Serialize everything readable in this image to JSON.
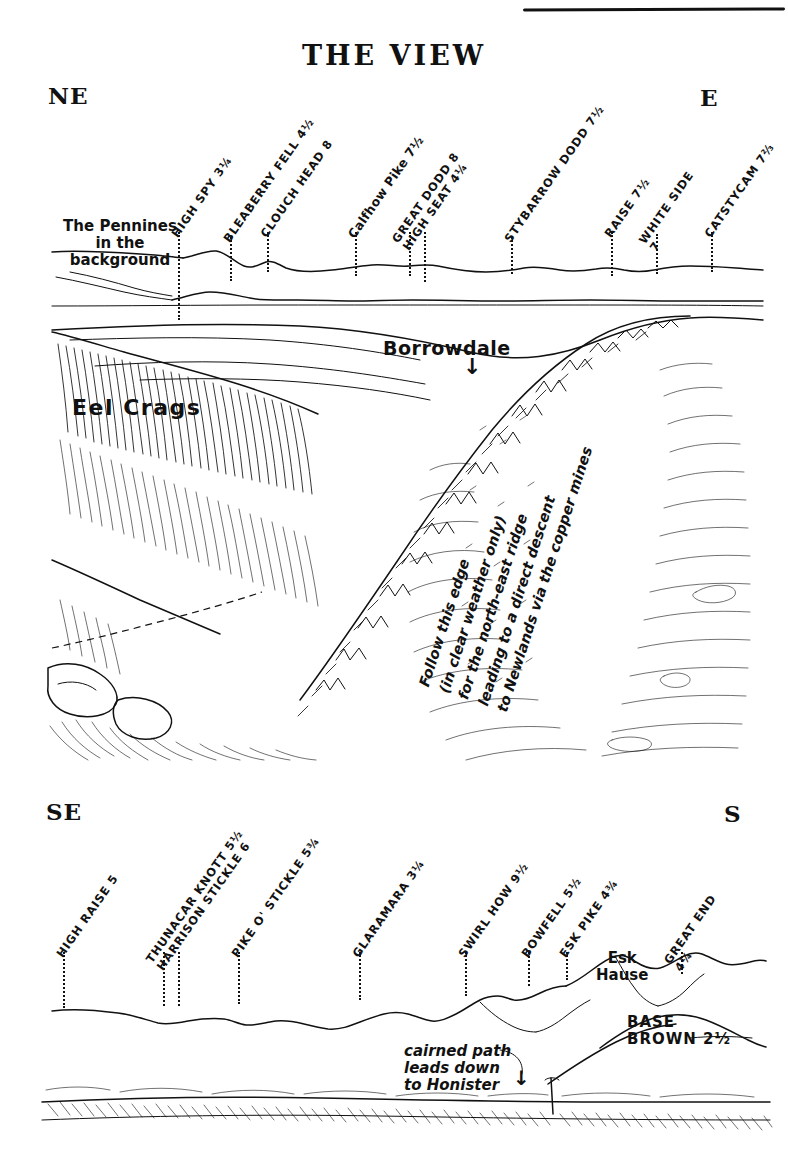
{
  "title": "THE VIEW",
  "top_panorama": {
    "left_compass": "NE",
    "right_compass": "E",
    "background_note": "The Pennines\nin the\nbackground",
    "background_note_lines": [
      "The Pennines",
      "in the",
      "background"
    ],
    "peaks": [
      {
        "label": "HIGH SPY 3¼",
        "name": "HIGH SPY",
        "distance": "3¼",
        "x": 178,
        "tick_top": 232,
        "tick_bottom": 320
      },
      {
        "label": "BLEABERRY FELL 4½",
        "name": "BLEABERRY FELL",
        "distance": "4½",
        "x": 230,
        "tick_top": 237,
        "tick_bottom": 281
      },
      {
        "label": "CLOUCH HEAD 8",
        "name": "CLOUCH HEAD",
        "distance": "8",
        "x": 267,
        "tick_top": 232,
        "tick_bottom": 272
      },
      {
        "label": "Calfhow Pike 7½",
        "name": "Calfhow Pike",
        "distance": "7½",
        "x": 355,
        "tick_top": 232,
        "tick_bottom": 276
      },
      {
        "label": "GREAT DODD 8",
        "name": "GREAT DODD",
        "distance": "8",
        "x": 409,
        "tick_top": 232,
        "tick_bottom": 276
      },
      {
        "label": "HIGH SEAT 4¼",
        "name": "HIGH SEAT",
        "distance": "4¼",
        "x": 424,
        "tick_top": 232,
        "tick_bottom": 282
      },
      {
        "label": "STYBARROW DODD 7½",
        "name": "STYBARROW DODD",
        "distance": "7½",
        "x": 511,
        "tick_top": 237,
        "tick_bottom": 274
      },
      {
        "label": "RAISE 7½",
        "name": "RAISE",
        "distance": "7½",
        "x": 611,
        "tick_top": 232,
        "tick_bottom": 276
      },
      {
        "label": "WHITE SIDE 7",
        "name": "WHITE SIDE",
        "distance": "7",
        "x": 656,
        "tick_top": 234,
        "tick_bottom": 274
      },
      {
        "label": "CATSTYCAM 7⅔",
        "name": "CATSTYCAM",
        "distance": "7⅔",
        "x": 711,
        "tick_top": 232,
        "tick_bottom": 272
      }
    ]
  },
  "middle_panel": {
    "crag_label": "Eel Crags",
    "valley_label": "Borrowdale",
    "valley_arrow": "↓",
    "route_note_lines": [
      "Follow this edge",
      "(in clear weather only)",
      "for the north-east ridge",
      "leading to a direct descent",
      "to Newlands via the copper mines"
    ]
  },
  "bottom_panorama": {
    "left_compass": "SE",
    "right_compass": "S",
    "peaks": [
      {
        "label": "HIGH RAISE 5",
        "name": "HIGH RAISE",
        "distance": "5",
        "x": 63,
        "tick_top": 952,
        "tick_bottom": 1008
      },
      {
        "label": "THUNACAR KNOTT 5½",
        "name": "THUNACAR KNOTT",
        "distance": "5½",
        "x": 163,
        "tick_top": 952,
        "tick_bottom": 1006
      },
      {
        "label": "HARRISON STICKLE 6",
        "name": "HARRISON STICKLE",
        "distance": "6",
        "x": 178,
        "tick_top": 952,
        "tick_bottom": 1006
      },
      {
        "label": "PIKE O' STICKLE 5¾",
        "name": "PIKE O' STICKLE",
        "distance": "5¾",
        "x": 238,
        "tick_top": 952,
        "tick_bottom": 1004
      },
      {
        "label": "GLARAMARA 3¼",
        "name": "GLARAMARA",
        "distance": "3¼",
        "x": 359,
        "tick_top": 952,
        "tick_bottom": 1000
      },
      {
        "label": "SWIRL HOW 9½",
        "name": "SWIRL HOW",
        "distance": "9½",
        "x": 465,
        "tick_top": 952,
        "tick_bottom": 996
      },
      {
        "label": "BOWFELL 5½",
        "name": "BOWFELL",
        "distance": "5½",
        "x": 528,
        "tick_top": 952,
        "tick_bottom": 986
      },
      {
        "label": "ESK PIKE 4¾",
        "name": "ESK PIKE",
        "distance": "4¾",
        "x": 566,
        "tick_top": 952,
        "tick_bottom": 980
      },
      {
        "label": "GREAT END 4¼",
        "name": "GREAT END",
        "distance": "4¼",
        "x": 681,
        "tick_top": 952,
        "tick_bottom": 974
      }
    ],
    "col_label_lines": [
      "Esk",
      "Hause"
    ],
    "base_brown_lines": [
      "BASE",
      "BROWN 2½"
    ],
    "path_note_lines": [
      "cairned path",
      "leads down",
      "to Honister"
    ],
    "path_note_arrow": "↓"
  },
  "colors": {
    "ink": "#111111",
    "paper": "#ffffff"
  }
}
